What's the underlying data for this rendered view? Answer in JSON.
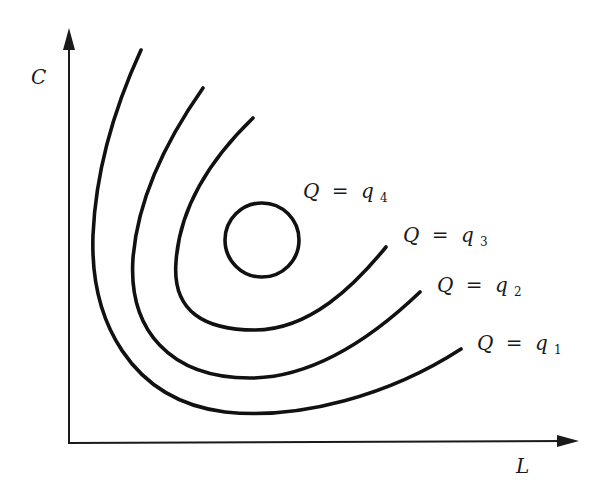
{
  "diagram": {
    "type": "isoquant-map",
    "axes": {
      "x_label": "L",
      "y_label": "C"
    },
    "curves": [
      {
        "id": "q1",
        "variable": "Q",
        "equals": "=",
        "level": "q",
        "subscript": "1",
        "shape": "open-curve",
        "order": "outermost"
      },
      {
        "id": "q2",
        "variable": "Q",
        "equals": "=",
        "level": "q",
        "subscript": "2",
        "shape": "open-curve"
      },
      {
        "id": "q3",
        "variable": "Q",
        "equals": "=",
        "level": "q",
        "subscript": "3",
        "shape": "open-curve"
      },
      {
        "id": "q4",
        "variable": "Q",
        "equals": "=",
        "level": "q",
        "subscript": "4",
        "shape": "closed-circle",
        "order": "innermost"
      }
    ],
    "colors": {
      "background": "#ffffff",
      "ink": "#111111"
    }
  }
}
